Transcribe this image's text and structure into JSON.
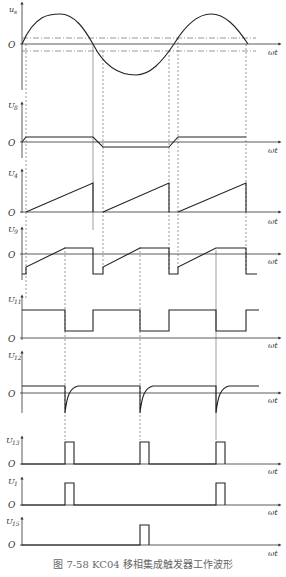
{
  "caption": "图 7-58  KC04 移相集成触发器工作波形",
  "x_axis_label": "ωt",
  "origin_label": "O",
  "panels": [
    {
      "id": "us",
      "ylabel": "u",
      "ylabel_sub": "s",
      "description": "Sinusoidal supply voltage with two dash-dot threshold lines"
    },
    {
      "id": "u8",
      "ylabel": "U",
      "ylabel_sub": "8",
      "description": "Square-ish wave, positive during positive half-cycle, negative during negative half"
    },
    {
      "id": "u4",
      "ylabel": "U",
      "ylabel_sub": "4",
      "description": "Sawtooth ramp each half-cycle"
    },
    {
      "id": "u9",
      "ylabel": "U",
      "ylabel_sub": "9",
      "description": "Offset ramp clipped at top, dropping negative at cycle end"
    },
    {
      "id": "u11",
      "ylabel": "U",
      "ylabel_sub": "11",
      "description": "Rectangular wave, low from ramp crossing to cycle end"
    },
    {
      "id": "u12",
      "ylabel": "U",
      "ylabel_sub": "12",
      "description": "Constant level with negative exponential spikes"
    },
    {
      "id": "u13",
      "ylabel": "U",
      "ylabel_sub": "13",
      "description": "Narrow pulses every half-cycle"
    },
    {
      "id": "u1",
      "ylabel": "U",
      "ylabel_sub": "1",
      "description": "Pulses on positive half-cycles"
    },
    {
      "id": "u15",
      "ylabel": "U",
      "ylabel_sub": "15",
      "description": "Pulse on negative half-cycle"
    }
  ]
}
